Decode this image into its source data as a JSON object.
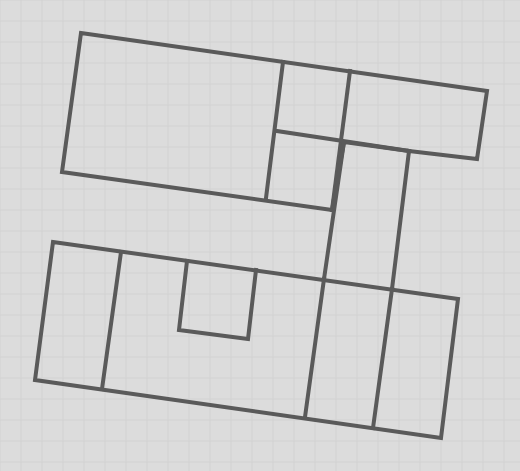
{
  "diagram": {
    "type": "floor-plan-outline",
    "background_color": "#dcdcdc",
    "grid_color": "#d2d2d2",
    "grid_spacing": 21,
    "line_color": "#5a5a5a",
    "line_width": 4,
    "shapes": [
      {
        "name": "upper-block-outline",
        "points": [
          [
            81,
            33
          ],
          [
            487,
            91
          ],
          [
            477,
            159
          ],
          [
            409,
            151
          ],
          [
            344,
            142
          ],
          [
            332,
            210
          ],
          [
            62,
            172
          ]
        ]
      },
      {
        "name": "upper-divider-vertical-left",
        "points": [
          [
            283,
            62
          ],
          [
            266,
            198
          ]
        ]
      },
      {
        "name": "upper-divider-vertical-right",
        "points": [
          [
            350,
            71
          ],
          [
            332,
            210
          ]
        ]
      },
      {
        "name": "upper-divider-horizontal",
        "points": [
          [
            277,
            131
          ],
          [
            409,
            151
          ]
        ]
      },
      {
        "name": "connector-left-vertical",
        "points": [
          [
            344,
            142
          ],
          [
            324,
            279
          ]
        ]
      },
      {
        "name": "connector-right-vertical",
        "points": [
          [
            409,
            151
          ],
          [
            392,
            289
          ]
        ]
      },
      {
        "name": "lower-block-outline",
        "points": [
          [
            53,
            242
          ],
          [
            458,
            299
          ],
          [
            441,
            438
          ],
          [
            35,
            380
          ]
        ]
      },
      {
        "name": "lower-divider-left",
        "points": [
          [
            121,
            252
          ],
          [
            102,
            389
          ]
        ]
      },
      {
        "name": "lower-divider-mid",
        "points": [
          [
            324,
            279
          ],
          [
            305,
            417
          ]
        ]
      },
      {
        "name": "lower-divider-right",
        "points": [
          [
            392,
            289
          ],
          [
            373,
            428
          ]
        ]
      },
      {
        "name": "lower-notch",
        "points": [
          [
            187,
            261
          ],
          [
            179,
            330
          ],
          [
            248,
            339
          ],
          [
            256,
            270
          ]
        ]
      }
    ]
  }
}
